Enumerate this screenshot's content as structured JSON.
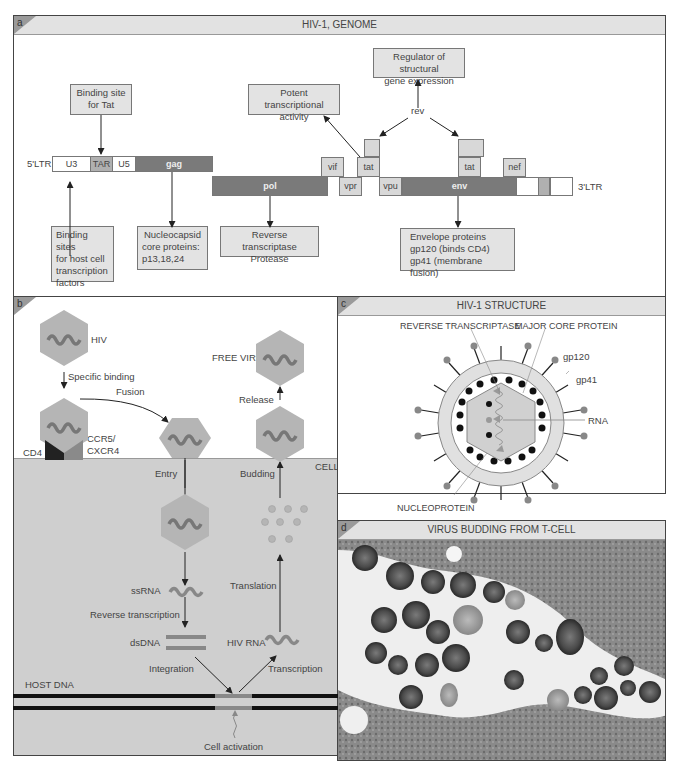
{
  "panel_a": {
    "letter": "a",
    "title": "HIV-1, GENOME",
    "ltr_5": "5'LTR",
    "ltr_3": "3'LTR",
    "genes": {
      "u3": "U3",
      "tar": "TAR",
      "u5": "U5",
      "gag": "gag",
      "pol": "pol",
      "vif": "vif",
      "vpr": "vpr",
      "tat1": "tat",
      "vpu": "vpu",
      "env": "env",
      "tat2": "tat",
      "nef": "nef"
    },
    "rev_label": "rev",
    "callouts": {
      "binding_tat": [
        "Binding site",
        "for Tat"
      ],
      "potent": [
        "Potent transcriptional",
        "activity"
      ],
      "regulator": [
        "Regulator of structural",
        "gene expression"
      ],
      "binding_host": [
        "Binding sites",
        "for host cell",
        "transcription",
        "factors"
      ],
      "nucleocapsid": [
        "Nucleocapsid",
        "core proteins:",
        "p13,18,24"
      ],
      "rt_protease": [
        "Reverse transcriptase",
        "Protease"
      ],
      "envelope": [
        "Envelope proteins",
        "gp120 (binds CD4)",
        "gp41 (membrane fusion)"
      ]
    }
  },
  "panel_b": {
    "letter": "b",
    "labels": {
      "hiv": "HIV",
      "specific_binding": "Specific binding",
      "fusion": "Fusion",
      "cd4": "CD4",
      "ccr5": "CCR5/",
      "cxcr4": "CXCR4",
      "free_virus": "FREE VIRUS",
      "release": "Release",
      "cell": "CELL",
      "entry": "Entry",
      "budding": "Budding",
      "ssrna": "ssRNA",
      "reverse_transcription": "Reverse transcription",
      "translation": "Translation",
      "dsdna": "dsDNA",
      "hiv_rna": "HIV RNA",
      "integration": "Integration",
      "transcription": "Transcription",
      "host_dna": "HOST DNA",
      "cell_activation": "Cell activation"
    }
  },
  "panel_c": {
    "letter": "c",
    "title": "HIV-1 STRUCTURE",
    "labels": {
      "reverse_transcriptase": "REVERSE TRANSCRIPTASE",
      "major_core_protein": "MAJOR CORE PROTEIN",
      "gp120": "gp120",
      "gp41": "gp41",
      "rna": "RNA",
      "nucleoprotein": "NUCLEOPROTEIN"
    }
  },
  "panel_d": {
    "letter": "d",
    "title": "VIRUS BUDDING FROM T-CELL"
  },
  "colors": {
    "header": "#e2e2e2",
    "virus": "#b5b5b5",
    "cell": "#cfcfcf",
    "dark_gene": "#7a7a7a",
    "border": "#444444"
  }
}
